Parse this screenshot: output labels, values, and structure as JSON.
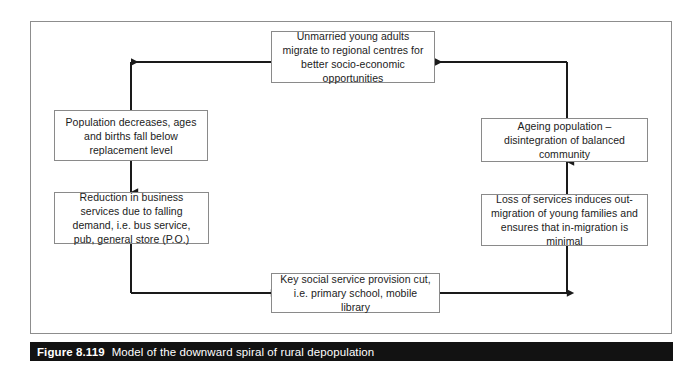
{
  "figure": {
    "caption_number": "Figure 8.119",
    "caption_title": "Model of the downward spiral of rural depopulation",
    "caption_bar_color": "#121212",
    "caption_text_color": "#ffffff",
    "frame_border_color": "#8d8d8d",
    "background_color": "#ffffff"
  },
  "diagram": {
    "type": "cycle-flow-diagram",
    "node_border_color": "#8a8a8a",
    "connector_color": "#1a1a1a",
    "nodes": [
      {
        "id": "migrate",
        "label": "Unmarried young adults migrate to regional centres for better socio-economic opportunities",
        "lines": [
          "Unmarried young adults migrate",
          "to regional centres for better",
          "socio-economic opportunities"
        ]
      },
      {
        "id": "population",
        "label": "Population decreases, ages and births fall below replacement level",
        "lines": [
          "Population decreases, ages and",
          "births fall below replacement",
          "level"
        ]
      },
      {
        "id": "reduction",
        "label": "Reduction in business services due to falling demand, i.e. bus service, pub, general store (P.O.)",
        "lines": [
          "Reduction in business services",
          "due to falling demand, i.e. bus",
          "service, pub, general store (P.O.)"
        ]
      },
      {
        "id": "keyservice",
        "label": "Key social service provision cut, i.e. primary school, mobile library",
        "lines": [
          "Key social service provision cut,",
          "i.e. primary school, mobile library"
        ]
      },
      {
        "id": "loss",
        "label": "Loss of services induces out-migration of young families and ensures that in-migration is minimal",
        "lines": [
          "Loss of services induces out-",
          "migration of young families and",
          "ensures that in-migration is minimal"
        ]
      },
      {
        "id": "ageing",
        "label": "Ageing population – disintegration of balanced community",
        "lines": [
          "Ageing population – disintegration",
          "of balanced community"
        ]
      }
    ],
    "connectors": [
      {
        "from": "migrate",
        "to": "population",
        "direction": "left-then-down",
        "arrow": "left"
      },
      {
        "from": "population",
        "to": "reduction",
        "direction": "down",
        "arrow": "down"
      },
      {
        "from": "reduction",
        "to": "keyservice",
        "direction": "down-then-right",
        "arrow": "right"
      },
      {
        "from": "keyservice",
        "to": "loss",
        "direction": "right-then-up",
        "arrow": "right"
      },
      {
        "from": "loss",
        "to": "ageing",
        "direction": "up",
        "arrow": "up"
      },
      {
        "from": "ageing",
        "to": "migrate",
        "direction": "up-then-left",
        "arrow": "left"
      }
    ]
  }
}
